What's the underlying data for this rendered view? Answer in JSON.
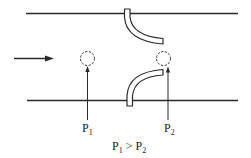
{
  "diagram": {
    "flow_direction": "left-to-right",
    "colors": {
      "line": "#2a2a2a",
      "background": "#ffffff"
    },
    "labels": {
      "p1": {
        "base": "P",
        "sub": "1"
      },
      "p2": {
        "base": "P",
        "sub": "2"
      },
      "relation": {
        "left_base": "P",
        "left_sub": "1",
        "op": ">",
        "right_base": "P",
        "right_sub": "2"
      }
    }
  }
}
